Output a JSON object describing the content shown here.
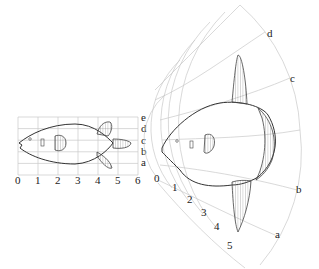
{
  "figure": {
    "left_panel": {
      "x_ticks": [
        "0",
        "1",
        "2",
        "3",
        "4",
        "5",
        "6"
      ],
      "y_ticks": [
        "e",
        "d",
        "c",
        "b",
        "a"
      ]
    },
    "right_panel": {
      "radial_ticks": [
        "0",
        "1",
        "2",
        "3",
        "4",
        "5"
      ],
      "arc_ticks": [
        "d",
        "c",
        "b",
        "a"
      ]
    },
    "colors": {
      "grid": "#c8c8c8",
      "outline": "#333333"
    }
  }
}
